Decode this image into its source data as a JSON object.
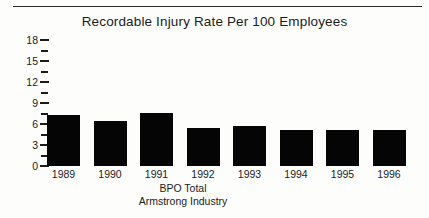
{
  "chart_data": {
    "type": "bar",
    "title": "Recordable Injury Rate Per 100 Employees",
    "xlabel": "",
    "ylabel": "",
    "categories": [
      "1989",
      "1990",
      "1991",
      "1992",
      "1993",
      "1994",
      "1995",
      "1996"
    ],
    "values": [
      7.3,
      6.4,
      7.6,
      5.4,
      5.7,
      5.1,
      5.1,
      5.1
    ],
    "ylim": [
      0,
      18
    ],
    "y_major_ticks": [
      0,
      3,
      6,
      9,
      12,
      15,
      18
    ],
    "y_minor_ticks": [
      1.5,
      4.5,
      7.5,
      10.5,
      13.5,
      16.5
    ],
    "y_tick_labels": [
      "0",
      "3",
      "6",
      "9",
      "12",
      "15",
      "18"
    ],
    "grid": false,
    "legend": false,
    "bar_color": "#050505",
    "axis_color": "#1b1b1b",
    "background_color": "#fdfdfc"
  },
  "caption": {
    "line1": "BPO Total",
    "line2": "Armstrong Industry"
  }
}
